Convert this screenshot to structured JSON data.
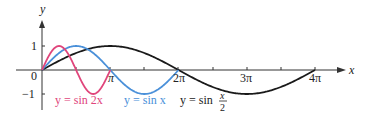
{
  "chart_data": {
    "type": "line",
    "title": "",
    "xlabel": "x",
    "ylabel": "y",
    "xlim": [
      0,
      12.566
    ],
    "ylim": [
      -1,
      1
    ],
    "x_ticks": [
      "π",
      "2π",
      "3π",
      "4π"
    ],
    "y_ticks": [
      "1",
      "-1"
    ],
    "origin_label": "0",
    "grid": false,
    "series": [
      {
        "name": "y = sin 2x",
        "color": "#e0457b",
        "formula": "sin(2x)",
        "domain": [
          0,
          3.1416
        ],
        "period": "π"
      },
      {
        "name": "y = sin x",
        "color": "#4a90d9",
        "formula": "sin(x)",
        "domain": [
          0,
          6.2832
        ],
        "period": "2π"
      },
      {
        "name": "y = sin x/2",
        "color": "#1a1a1a",
        "formula": "sin(x/2)",
        "domain": [
          0,
          12.566
        ],
        "period": "4π"
      }
    ]
  },
  "labels": {
    "x_axis": "x",
    "y_axis": "y",
    "origin": "0",
    "y_one": "1",
    "y_neg_one": "−1",
    "pi": "π",
    "two_pi": "2π",
    "three_pi": "3π",
    "four_pi": "4π",
    "legend_sin2x": "y = sin 2x",
    "legend_sinx": "y = sin x",
    "legend_sinhalf_prefix": "y = sin",
    "legend_sinhalf_num": "x",
    "legend_sinhalf_den": "2"
  }
}
